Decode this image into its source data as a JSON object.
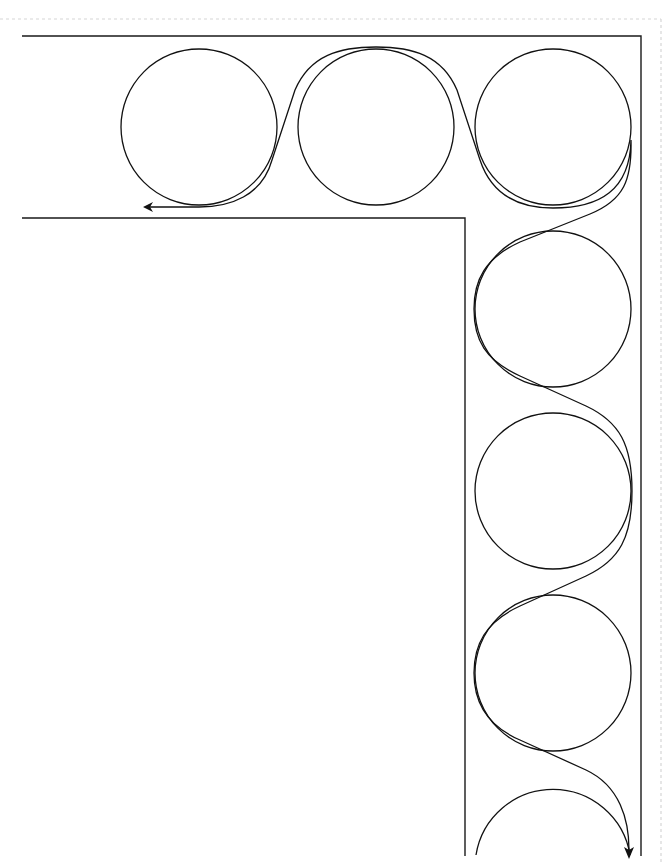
{
  "diagram": {
    "title": "",
    "colors": {
      "line": "#111111",
      "background": "#ffffff",
      "border_dotted": "#d6d6d6"
    },
    "rollers": [
      {
        "id": "roller-1",
        "cx": 199,
        "cy": 127,
        "r": 78
      },
      {
        "id": "roller-2",
        "cx": 376,
        "cy": 127,
        "r": 78
      },
      {
        "id": "roller-3",
        "cx": 553,
        "cy": 127,
        "r": 78
      },
      {
        "id": "roller-4",
        "cx": 553,
        "cy": 309,
        "r": 78
      },
      {
        "id": "roller-5",
        "cx": 553,
        "cy": 491,
        "r": 78
      },
      {
        "id": "roller-6",
        "cx": 553,
        "cy": 673,
        "r": 78
      },
      {
        "id": "roller-7",
        "cx": 553,
        "cy": 853,
        "r": 78
      }
    ],
    "channel": {
      "outer": {
        "top_y": 36,
        "left_x": 22,
        "right_x": 641,
        "bottom_y": 855
      },
      "inner": {
        "top_y": 218,
        "left_x": 22,
        "right_x": 465,
        "bottom_y": 855
      }
    },
    "belt": {
      "start_arrow": {
        "x": 144,
        "y": 207,
        "direction": "left"
      },
      "end_arrow": {
        "x": 629,
        "y": 858,
        "direction": "down"
      }
    }
  }
}
